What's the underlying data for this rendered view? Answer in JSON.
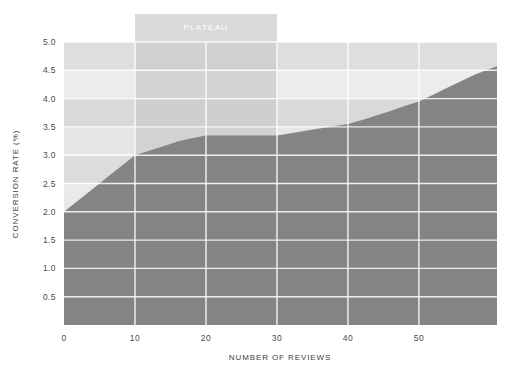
{
  "chart_data": {
    "type": "area",
    "title": "",
    "subtitle": "",
    "xlabel": "NUMBER OF REVIEWS",
    "ylabel": "CONVERSION RATE (%)",
    "xlim": [
      0,
      61
    ],
    "ylim": [
      0,
      5.0
    ],
    "grid": true,
    "legend": "none",
    "x": [
      0,
      2,
      4,
      6,
      8,
      10,
      12,
      14,
      16,
      18,
      20,
      22,
      24,
      26,
      28,
      30,
      32,
      34,
      36,
      38,
      40,
      42,
      44,
      46,
      48,
      50,
      52,
      54,
      56,
      58,
      61
    ],
    "values": [
      2.0,
      2.2,
      2.4,
      2.6,
      2.8,
      3.0,
      3.08,
      3.16,
      3.24,
      3.3,
      3.35,
      3.35,
      3.35,
      3.35,
      3.35,
      3.35,
      3.39,
      3.43,
      3.47,
      3.51,
      3.55,
      3.62,
      3.7,
      3.78,
      3.87,
      3.95,
      4.07,
      4.19,
      4.31,
      4.43,
      4.57
    ],
    "series": [
      {
        "name": "Conversion rate",
        "values": [
          2.0,
          2.2,
          2.4,
          2.6,
          2.8,
          3.0,
          3.08,
          3.16,
          3.24,
          3.3,
          3.35,
          3.35,
          3.35,
          3.35,
          3.35,
          3.35,
          3.39,
          3.43,
          3.47,
          3.51,
          3.55,
          3.62,
          3.7,
          3.78,
          3.87,
          3.95,
          4.07,
          4.19,
          4.31,
          4.43,
          4.57
        ]
      }
    ],
    "xticks": [
      "0",
      "10",
      "20",
      "30",
      "40",
      "50"
    ],
    "xtick_values": [
      0,
      10,
      20,
      30,
      40,
      50
    ],
    "yticks": [
      "0.5",
      "1.0",
      "1.5",
      "2.0",
      "2.5",
      "3.0",
      "3.5",
      "4.0",
      "4.5",
      "5.0"
    ],
    "ytick_values": [
      0.5,
      1.0,
      1.5,
      2.0,
      2.5,
      3.0,
      3.5,
      4.0,
      4.5,
      5.0
    ],
    "annotations": [
      {
        "label": "PLATEAU",
        "x_start": 10,
        "x_end": 30,
        "type": "vertical-band"
      }
    ],
    "colors": {
      "background": "#ffffff",
      "band_light": "#e0e0e0",
      "band_lighter": "#efefef",
      "area_fill": "#8d8d8d",
      "area_fill_dark": "#7a7a7a",
      "gridline": "#ffffff",
      "annotation_band": "#cfcfcf",
      "annotation_text": "#ffffff",
      "tick_text": "#4a4a4a",
      "axis_title": "#3d3d3d"
    }
  }
}
